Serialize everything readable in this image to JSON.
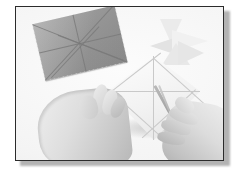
{
  "figure": {
    "caption": "Hands cutting a creased folded paper with scissors",
    "background_color": "#f7f7f7",
    "frame_color": "#2b2b2b",
    "shadow_color": "#9a9a9a"
  },
  "objects": {
    "gray_paper": {
      "name": "creased gray paper square",
      "color": "#9b9b9b",
      "crease_color": "#7a7a7a",
      "rotation_deg": -13,
      "creases": [
        {
          "x": 0,
          "y": 0,
          "len": 102,
          "angle": 34.6
        },
        {
          "x": 84,
          "y": 0,
          "len": 102,
          "angle": 145.4
        },
        {
          "x": 0,
          "y": 29,
          "len": 84,
          "angle": 0
        },
        {
          "x": 42,
          "y": 0,
          "len": 58,
          "angle": 90
        },
        {
          "x": 0,
          "y": 58,
          "len": 70,
          "angle": -34
        },
        {
          "x": 84,
          "y": 58,
          "len": 70,
          "angle": 214
        }
      ]
    },
    "white_model": {
      "name": "folded white paper model",
      "color": "#f2f2f2",
      "shade_color": "#e2e2e2",
      "triangles": [
        {
          "left": 14,
          "top": 0,
          "w": 22,
          "h": 24,
          "tone": "#eeeeee",
          "dir": "down-right"
        },
        {
          "left": 4,
          "top": 18,
          "w": 30,
          "h": 20,
          "tone": "#e6e6e6",
          "dir": "down-left"
        },
        {
          "left": 26,
          "top": 12,
          "w": 34,
          "h": 22,
          "tone": "#f0f0f0",
          "dir": "left-down"
        },
        {
          "left": 18,
          "top": 26,
          "w": 26,
          "h": 22,
          "tone": "#e9e9e9",
          "dir": "up-right"
        }
      ]
    },
    "kite_paper": {
      "name": "creased kite-shaped paper being cut",
      "color": "#f4f4f4",
      "crease_color": "#c9c9c9",
      "creases": [
        {
          "x": 50,
          "y": 0,
          "len": 84,
          "angle": 90
        },
        {
          "x": 4,
          "y": 35,
          "len": 92,
          "angle": 0
        },
        {
          "x": 4,
          "y": 35,
          "len": 66,
          "angle": -38
        },
        {
          "x": 50,
          "y": 0,
          "len": 72,
          "angle": 42
        },
        {
          "x": 4,
          "y": 35,
          "len": 74,
          "angle": 42
        },
        {
          "x": 96,
          "y": 35,
          "len": 74,
          "angle": 138
        }
      ]
    },
    "left_hand": {
      "name": "left hand holding paper",
      "skin_tone": "#d8d8d8"
    },
    "right_hand": {
      "name": "right hand holding scissors",
      "skin_tone": "#d4d4d4"
    },
    "scissors": {
      "name": "scissors",
      "blade_color": "#a3a3a3",
      "handle_color": "#6e6e6e",
      "blades": [
        {
          "x": 0,
          "y": 0,
          "len": 58,
          "thick": 2.6,
          "angle": 61
        },
        {
          "x": 3,
          "y": 0,
          "len": 56,
          "thick": 2.2,
          "angle": 68
        }
      ]
    }
  }
}
